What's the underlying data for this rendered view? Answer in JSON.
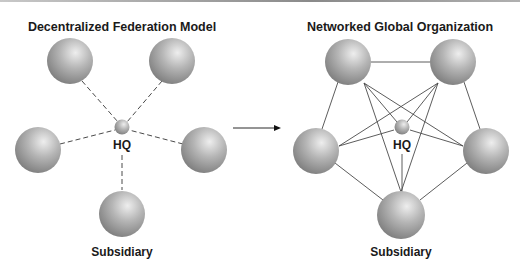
{
  "left_diagram": {
    "title": "Decentralized Federation Model",
    "hq_label": "HQ",
    "subsidiary_label": "Subsidiary",
    "connection_style": "dashed",
    "nodes": [
      "subsidiary-top-left",
      "subsidiary-top-right",
      "subsidiary-left",
      "subsidiary-right",
      "subsidiary-bottom"
    ],
    "connections": "each subsidiary linked only to HQ"
  },
  "right_diagram": {
    "title": "Networked Global Organization",
    "hq_label": "HQ",
    "subsidiary_label": "Subsidiary",
    "connection_style": "solid",
    "nodes": [
      "subsidiary-top-left",
      "subsidiary-top-right",
      "subsidiary-left",
      "subsidiary-right",
      "subsidiary-bottom"
    ],
    "connections": "all subsidiaries interconnected and linked to HQ"
  },
  "arrow": {
    "direction": "right"
  },
  "colors": {
    "sphere_light": "#e6e6e6",
    "sphere_dark": "#7d7d7d",
    "line": "#4a4a4a",
    "text": "#1a1a1a"
  }
}
